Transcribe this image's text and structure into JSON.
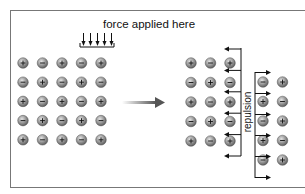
{
  "labels": {
    "force": "force applied here",
    "repulsion": "repulsion"
  },
  "colors": {
    "ion_fill": "#8a8a8a",
    "ion_light": "#d8d8d8",
    "line": "#222222",
    "arrow_gray": "#666666"
  },
  "left_grid": [
    [
      "+",
      "-",
      "+",
      "-",
      "+"
    ],
    [
      "-",
      "+",
      "-",
      "+",
      "-"
    ],
    [
      "+",
      "-",
      "+",
      "-",
      "+"
    ],
    [
      "-",
      "+",
      "-",
      "+",
      "-"
    ],
    [
      "+",
      "-",
      "+",
      "-",
      "+"
    ]
  ],
  "right_block_a": [
    [
      "+",
      "-",
      "+"
    ],
    [
      "-",
      "+",
      "-"
    ],
    [
      "+",
      "-",
      "+"
    ],
    [
      "-",
      "+",
      "-"
    ],
    [
      "+",
      "-",
      "+"
    ]
  ],
  "right_block_b": [
    [
      "-",
      "+"
    ],
    [
      "+",
      "-"
    ],
    [
      "-",
      "+"
    ],
    [
      "+",
      "-"
    ],
    [
      "-",
      "+"
    ]
  ]
}
